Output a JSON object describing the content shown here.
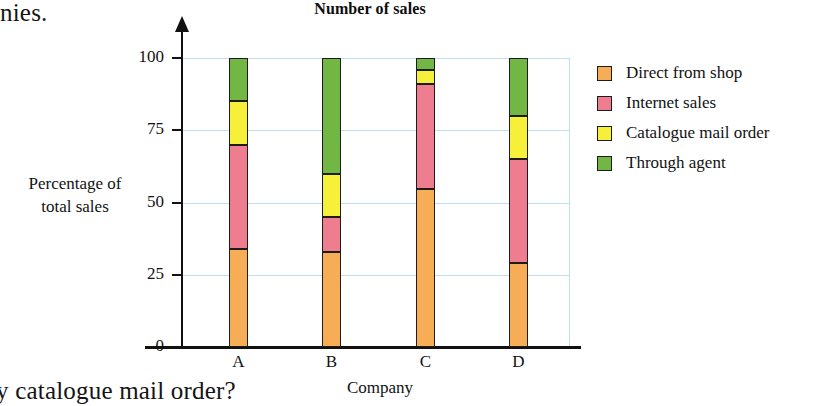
{
  "page": {
    "top_text_fragment": "nies.",
    "bottom_text_fragment": "y catalogue mail order?"
  },
  "chart_data": {
    "type": "bar",
    "subtype": "stacked-bar-percentage",
    "title": "Number of sales",
    "xlabel": "Company",
    "ylabel": "Percentage of\ntotal sales",
    "ylabel_line1": "Percentage of",
    "ylabel_line2": "total sales",
    "categories": [
      "A",
      "B",
      "C",
      "D"
    ],
    "ylim": [
      0,
      100
    ],
    "yticks": [
      0,
      25,
      50,
      75,
      100
    ],
    "ytick_labels": [
      "0",
      "25",
      "50",
      "75",
      "100"
    ],
    "grid": true,
    "grid_color": "#bfe0f0",
    "legend_position": "right",
    "series": [
      {
        "name": "Direct from shop",
        "color": "#f6ad55",
        "values": [
          34,
          33,
          54.5,
          29
        ]
      },
      {
        "name": "Internet sales",
        "color": "#ee7d90",
        "values": [
          36,
          12,
          36.5,
          36
        ]
      },
      {
        "name": "Catalogue mail order",
        "color": "#f6f03a",
        "values": [
          15,
          15,
          5,
          15
        ]
      },
      {
        "name": "Through agent",
        "color": "#72b744",
        "values": [
          15,
          40,
          4,
          20
        ]
      }
    ],
    "cumulative_tops": {
      "A": [
        34,
        70,
        85,
        100
      ],
      "B": [
        33,
        45,
        60,
        100
      ],
      "C": [
        54.5,
        91,
        96,
        100
      ],
      "D": [
        29,
        65,
        80,
        100
      ]
    }
  }
}
